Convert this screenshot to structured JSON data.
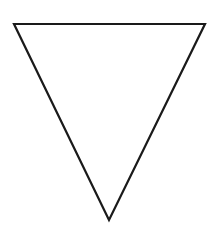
{
  "diagram": {
    "shape": "inverted-triangle",
    "fill": "#ffffff",
    "stroke": "#1a1a1a",
    "stroke_width": 2.2,
    "vertices": {
      "top_left": [
        14,
        24
      ],
      "top_right": [
        205,
        24
      ],
      "bottom": [
        109,
        220
      ]
    }
  }
}
